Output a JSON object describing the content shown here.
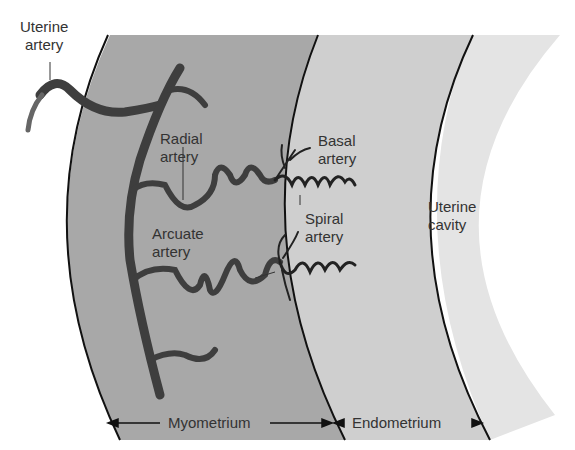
{
  "labels": {
    "uterine_artery": [
      "Uterine",
      "artery"
    ],
    "radial_artery": [
      "Radial",
      "artery"
    ],
    "basal_artery": [
      "Basal",
      "artery"
    ],
    "spiral_artery": [
      "Spiral",
      "artery"
    ],
    "arcuate_artery": [
      "Arcuate",
      "artery"
    ],
    "uterine_cavity": [
      "Uterine",
      "cavity"
    ],
    "myometrium": "Myometrium",
    "endometrium": "Endometrium"
  },
  "colors": {
    "myometrium": "#a8a8a8",
    "endometrium": "#cfcfcf",
    "cavity_band": "#e4e4e4",
    "artery": "#3e3e3e",
    "outline": "#111111"
  }
}
